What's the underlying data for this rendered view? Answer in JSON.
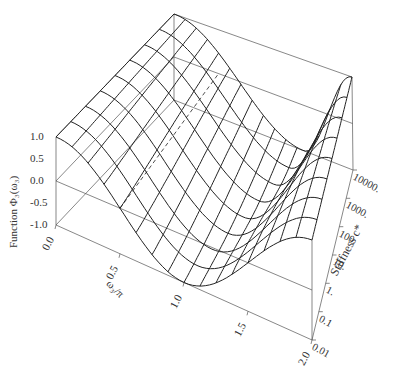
{
  "chart_data": {
    "type": "surface3d",
    "title": "",
    "xlabel": "ω₃/π",
    "ylabel": "Stiffness c*",
    "zlabel": "Function Φ₃(ω₃)",
    "x_ticks": [
      "0.0",
      "0.5",
      "1.0",
      "1.5",
      "2.0"
    ],
    "x_range": [
      0,
      2
    ],
    "y_ticks": [
      "0.01",
      "0.1",
      "1.",
      "10.",
      "100.",
      "1000.",
      "10000."
    ],
    "y_scale": "log",
    "y_range": [
      0.01,
      10000
    ],
    "z_ticks": [
      "-1.0",
      "-0.5",
      "0.0",
      "0.5",
      "1.0"
    ],
    "z_range": [
      -1,
      1
    ],
    "mesh": {
      "omega_lines": 17,
      "stiffness_lines": 9
    },
    "surface_description": "Valley-shaped surface: Φ=1 at ω/π=0 and ω/π=2; minimum of -1 near ω/π≈1 for low stiffness, shifting toward ω/π≈1.5 with a steeper rise for high stiffness",
    "min_location_low_c": 1.0,
    "min_location_high_c": 1.45,
    "dashed_line": {
      "z": 0,
      "omega": 0.5,
      "along": "stiffness"
    },
    "grid": false,
    "box": true
  },
  "colors": {
    "mesh": "#222222",
    "box": "#555555",
    "text": "#333333"
  }
}
